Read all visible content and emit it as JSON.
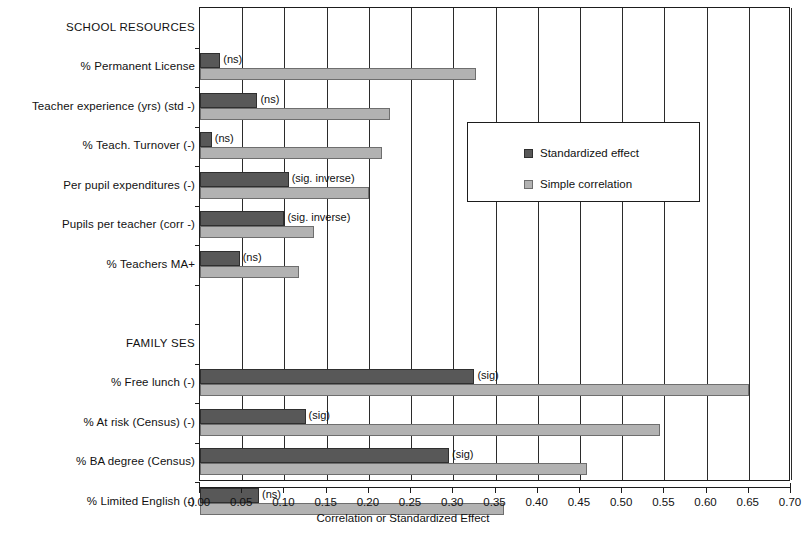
{
  "chart_data": {
    "type": "bar",
    "orientation": "horizontal",
    "title": "",
    "xlabel": "Correlation or Standardized Effect",
    "ylabel": "",
    "xlim": [
      0.0,
      0.7
    ],
    "xticks": [
      "0.00",
      "0.05",
      "0.10",
      "0.15",
      "0.20",
      "0.25",
      "0.30",
      "0.35",
      "0.40",
      "0.45",
      "0.50",
      "0.55",
      "0.60",
      "0.65",
      "0.70"
    ],
    "xtick_values": [
      0.0,
      0.05,
      0.1,
      0.15,
      0.2,
      0.25,
      0.3,
      0.35,
      0.4,
      0.45,
      0.5,
      0.55,
      0.6,
      0.65,
      0.7
    ],
    "grid": "vertical",
    "legend_position": "center-right",
    "legend": [
      {
        "name": "Standardized effect",
        "color": "#585858"
      },
      {
        "name": "Simple correlation",
        "color": "#b2b2b2"
      }
    ],
    "series": [
      {
        "name": "Standardized effect",
        "color": "#585858",
        "values": [
          null,
          0.024,
          0.068,
          0.014,
          0.105,
          0.1,
          0.047,
          null,
          null,
          0.325,
          0.125,
          0.295,
          0.07
        ]
      },
      {
        "name": "Simple correlation",
        "color": "#b2b2b2",
        "values": [
          null,
          0.327,
          0.225,
          0.215,
          0.2,
          0.135,
          0.117,
          null,
          null,
          0.65,
          0.545,
          0.458,
          0.36
        ]
      }
    ],
    "categories": [
      "SCHOOL RESOURCES",
      "% Permanent License",
      "Teacher experience (yrs) (std -)",
      "% Teach. Turnover (-)",
      "Per pupil expenditures (-)",
      "Pupils per teacher (corr -)",
      "% Teachers MA+",
      "",
      "FAMILY SES",
      "% Free lunch (-)",
      "% At risk (Census) (-)",
      "% BA degree (Census)",
      "% Limited English (-)"
    ],
    "category_types": [
      "header",
      "data",
      "data",
      "data",
      "data",
      "data",
      "data",
      "blank",
      "header",
      "data",
      "data",
      "data",
      "data"
    ],
    "annotations": [
      null,
      "(ns)",
      "(ns)",
      "(ns)",
      "(sig. inverse)",
      "(sig. inverse)",
      "(ns)",
      null,
      null,
      "(sig)",
      "(sig)",
      "(sig)",
      "(ns)"
    ]
  },
  "colors": {
    "standardized_effect": "#585858",
    "simple_correlation": "#b2b2b2",
    "axis": "#1d1d1d",
    "grid": "#2b2b2b",
    "background": "#ffffff"
  }
}
